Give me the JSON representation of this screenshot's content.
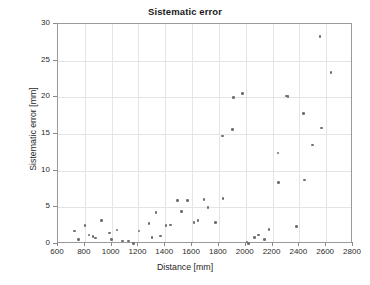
{
  "chart_data": {
    "type": "scatter",
    "title": "Sistematic error",
    "xlabel": "Distance [mm]",
    "ylabel": "Sistematic error [mm]",
    "xlim": [
      600,
      2800
    ],
    "ylim": [
      0,
      30
    ],
    "xticks": [
      600,
      800,
      1000,
      1200,
      1400,
      1600,
      1800,
      2000,
      2200,
      2400,
      2600,
      2800
    ],
    "yticks": [
      0,
      5,
      10,
      15,
      20,
      25,
      30
    ],
    "xtick_labels": [
      "600",
      "800",
      "1000",
      "1200",
      "1400",
      "1600",
      "1800",
      "2000",
      "2200",
      "2400",
      "2600",
      "2800"
    ],
    "ytick_labels": [
      "0",
      "5",
      "10",
      "15",
      "20",
      "25",
      "30"
    ],
    "grid": true,
    "legend": null,
    "marker_color": "#6f6f6f",
    "grid_color": "#e4e4e4",
    "axis_color": "#9a9a9a",
    "background": "#ffffff",
    "series": [
      {
        "name": "Sistematic error",
        "points": [
          [
            725,
            1.8
          ],
          [
            755,
            0.6
          ],
          [
            800,
            2.5
          ],
          [
            830,
            1.2
          ],
          [
            860,
            1.0
          ],
          [
            880,
            0.8
          ],
          [
            925,
            3.2
          ],
          [
            985,
            1.5
          ],
          [
            1000,
            0.6
          ],
          [
            1040,
            1.9
          ],
          [
            1080,
            0.4
          ],
          [
            1125,
            0.4
          ],
          [
            1165,
            0.1
          ],
          [
            1205,
            1.8
          ],
          [
            1280,
            2.8
          ],
          [
            1300,
            0.9
          ],
          [
            1330,
            4.3
          ],
          [
            1365,
            1.1
          ],
          [
            1405,
            2.5
          ],
          [
            1440,
            2.6
          ],
          [
            1490,
            5.9
          ],
          [
            1520,
            4.4
          ],
          [
            1565,
            5.9
          ],
          [
            1615,
            2.9
          ],
          [
            1645,
            3.2
          ],
          [
            1690,
            6.1
          ],
          [
            1720,
            5.0
          ],
          [
            1775,
            2.9
          ],
          [
            1825,
            14.7
          ],
          [
            1830,
            6.2
          ],
          [
            1900,
            15.6
          ],
          [
            1910,
            20.0
          ],
          [
            1975,
            20.5
          ],
          [
            2010,
            0.3
          ],
          [
            2020,
            0.1
          ],
          [
            2065,
            0.9
          ],
          [
            2095,
            1.2
          ],
          [
            2140,
            0.6
          ],
          [
            2175,
            2.0
          ],
          [
            2240,
            12.4
          ],
          [
            2245,
            8.4
          ],
          [
            2305,
            20.2
          ],
          [
            2315,
            20.1
          ],
          [
            2380,
            2.4
          ],
          [
            2430,
            17.8
          ],
          [
            2440,
            8.7
          ],
          [
            2500,
            13.5
          ],
          [
            2555,
            28.3
          ],
          [
            2565,
            15.8
          ],
          [
            2635,
            23.4
          ]
        ]
      }
    ]
  }
}
